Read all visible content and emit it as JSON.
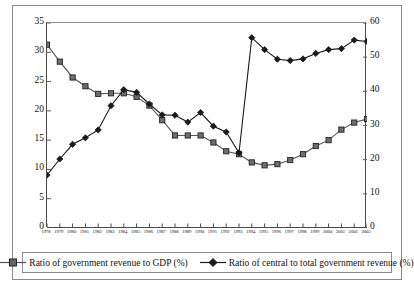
{
  "chart_data": {
    "type": "line",
    "title": "",
    "xlabel": "",
    "ylabel": "",
    "y2label": "",
    "grid": false,
    "legend_position": "bottom",
    "categories": [
      "1978",
      "1979",
      "1980",
      "1981",
      "1982",
      "1983",
      "1984",
      "1985",
      "1986",
      "1987",
      "1988",
      "1989",
      "1990",
      "1991",
      "1992",
      "1993",
      "1994",
      "1995",
      "1996",
      "1997",
      "1998",
      "1999",
      "2000",
      "2001",
      "2002",
      "2003"
    ],
    "ylim": [
      0,
      35
    ],
    "yticks": [
      0,
      5,
      10,
      15,
      20,
      25,
      30,
      35
    ],
    "y2lim": [
      0,
      60
    ],
    "y2ticks": [
      0,
      10,
      20,
      30,
      40,
      50,
      60
    ],
    "series": [
      {
        "name": "Ratio of government revenue to GDP (%)",
        "axis": "left",
        "marker": "square",
        "color": "#555555",
        "values": [
          31.3,
          28.4,
          25.7,
          24.2,
          22.9,
          23.0,
          23.0,
          22.4,
          20.9,
          18.4,
          15.8,
          15.8,
          15.8,
          14.6,
          13.1,
          12.6,
          11.2,
          10.7,
          10.9,
          11.6,
          12.6,
          14.0,
          15.0,
          16.8,
          18.0,
          18.6
        ]
      },
      {
        "name": "Ratio of central to total government revenue (%)",
        "axis": "right",
        "marker": "diamond",
        "color": "#1a1a1a",
        "values": [
          15.5,
          20.2,
          24.5,
          26.4,
          28.7,
          35.8,
          40.5,
          39.7,
          36.3,
          33.1,
          33.0,
          31.0,
          33.8,
          29.8,
          28.1,
          22.0,
          55.7,
          52.2,
          49.4,
          49.0,
          49.5,
          51.1,
          52.2,
          52.5,
          55.0,
          54.6
        ]
      }
    ]
  },
  "axes": {
    "left_ticks": [
      "35",
      "30",
      "25",
      "20",
      "15",
      "10",
      "5",
      "0"
    ],
    "right_ticks": [
      "60",
      "50",
      "40",
      "30",
      "20",
      "10",
      "0"
    ]
  },
  "legend": {
    "items": [
      {
        "label": "Ratio of government revenue to GDP (%)",
        "marker": "square-marker-icon"
      },
      {
        "label": "Ratio of central to total government revenue (%)",
        "marker": "diamond-marker-icon"
      }
    ]
  }
}
